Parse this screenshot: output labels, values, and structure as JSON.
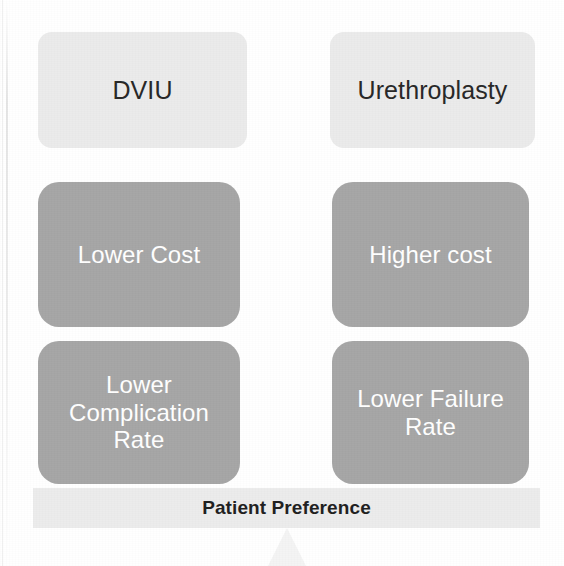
{
  "figure": {
    "background_color": "#ffffff",
    "width": 564,
    "height": 566
  },
  "colors": {
    "header_box": "#ebebeb",
    "attribute_box": "#a6a6a6",
    "banner": "#ececec",
    "header_text": "#272727",
    "attribute_text": "#ffffff",
    "banner_text": "#1f1f1f",
    "arrow": "#f4f4f4"
  },
  "columns": [
    {
      "id": "dviu",
      "header": "DVIU",
      "attributes": [
        "Lower Cost",
        "Lower\nComplication\nRate"
      ]
    },
    {
      "id": "urethroplasty",
      "header": "Urethroplasty",
      "attributes": [
        "Higher cost",
        "Lower Failure\nRate"
      ]
    }
  ],
  "banner": {
    "label": "Patient Preference"
  },
  "arrow": {
    "name": "up-arrow",
    "direction": "up"
  }
}
